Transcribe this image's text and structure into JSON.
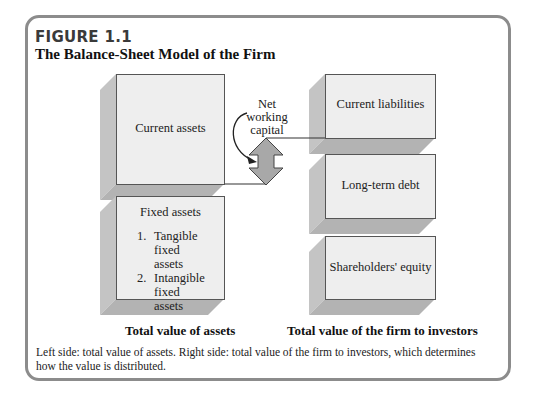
{
  "figure": {
    "label": "FIGURE 1.1",
    "title": "The Balance-Sheet Model of the Firm"
  },
  "left_side": {
    "current_assets": "Current assets",
    "fixed_assets": {
      "heading": "Fixed assets",
      "items": [
        {
          "num": "1.",
          "text": "Tangible fixed",
          "text2": "assets"
        },
        {
          "num": "2.",
          "text": "Intangible fixed",
          "text2": "assets"
        }
      ]
    },
    "caption": "Total value of assets"
  },
  "right_side": {
    "current_liabilities": "Current liabilities",
    "long_term_debt": "Long-term debt",
    "shareholders_equity": "Shareholders' equity",
    "caption": "Total value of the firm to investors"
  },
  "annotation": {
    "line1": "Net",
    "line2": "working",
    "line3": "capital"
  },
  "note": "Left side: total value of assets. Right side: total value of the firm to investors, which determines how the value is distributed.",
  "colors": {
    "box_face": "#eeeeee",
    "box_depth": "#bdbdbd",
    "arrow_fill": "#a8a8a8",
    "frame": "#8c8c8c"
  }
}
